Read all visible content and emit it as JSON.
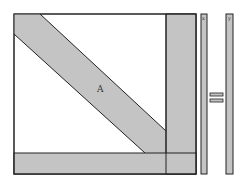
{
  "diagram": {
    "matrix_label": "A",
    "vector_x_label": "x",
    "vector_y_label": "y",
    "operator": "=",
    "colors": {
      "fill": "#c4c4c4",
      "stroke": "#222222",
      "background": "#ffffff"
    }
  }
}
